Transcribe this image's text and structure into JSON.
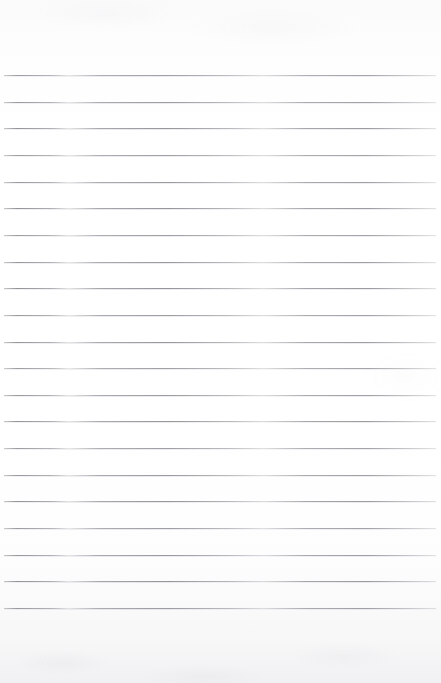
{
  "document": {
    "kind": "ruled-notebook-paper",
    "title": "Blank lined paper",
    "content_text": "",
    "has_handwriting": false,
    "width_px": 441,
    "height_px": 683
  },
  "palette": {
    "paper": "#fbfbfc",
    "paper_highlight": "#ffffff",
    "paper_bottom_edge": "#f1f1f3",
    "rule_line": "#8a8a90",
    "rule_line_faded": "#c4c4ca"
  },
  "ruling": {
    "line_count": 21,
    "first_line_y": 75,
    "last_line_y": 608,
    "spacing_px": 26.65,
    "line_thickness_px": 1,
    "left_inset_px": 4,
    "right_inset_px": 5,
    "top_margin_px": 75,
    "bottom_margin_px": 75,
    "line_y_positions": [
      75,
      101.6,
      128.3,
      154.9,
      181.6,
      208.2,
      234.9,
      261.5,
      288.2,
      314.8,
      341.5,
      368.1,
      394.8,
      421.4,
      448.1,
      474.7,
      501.4,
      528.0,
      554.7,
      581.3,
      608.0
    ]
  }
}
